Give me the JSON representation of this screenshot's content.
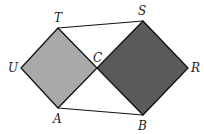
{
  "diagram": {
    "colors": {
      "left_square_fill": "#a9a9a9",
      "right_square_fill": "#5a5a5a",
      "stroke": "#111111",
      "background": "#ffffff"
    },
    "points": {
      "T": [
        58,
        28
      ],
      "U": [
        21,
        68
      ],
      "A": [
        58,
        108
      ],
      "C": [
        97,
        68
      ],
      "S": [
        143,
        21
      ],
      "R": [
        188,
        68
      ],
      "B": [
        143,
        115
      ]
    },
    "shapes": [
      {
        "name": "square-TUAC",
        "vertices": [
          "T",
          "U",
          "A",
          "C"
        ],
        "fill": "light gray"
      },
      {
        "name": "square-SCBR",
        "vertices": [
          "S",
          "C",
          "B",
          "R"
        ],
        "fill": "dark gray"
      }
    ],
    "segments": [
      [
        "T",
        "S"
      ],
      [
        "A",
        "B"
      ]
    ],
    "labels": {
      "T": "T",
      "S": "S",
      "U": "U",
      "C": "C",
      "R": "R",
      "A": "A",
      "B": "B"
    }
  }
}
